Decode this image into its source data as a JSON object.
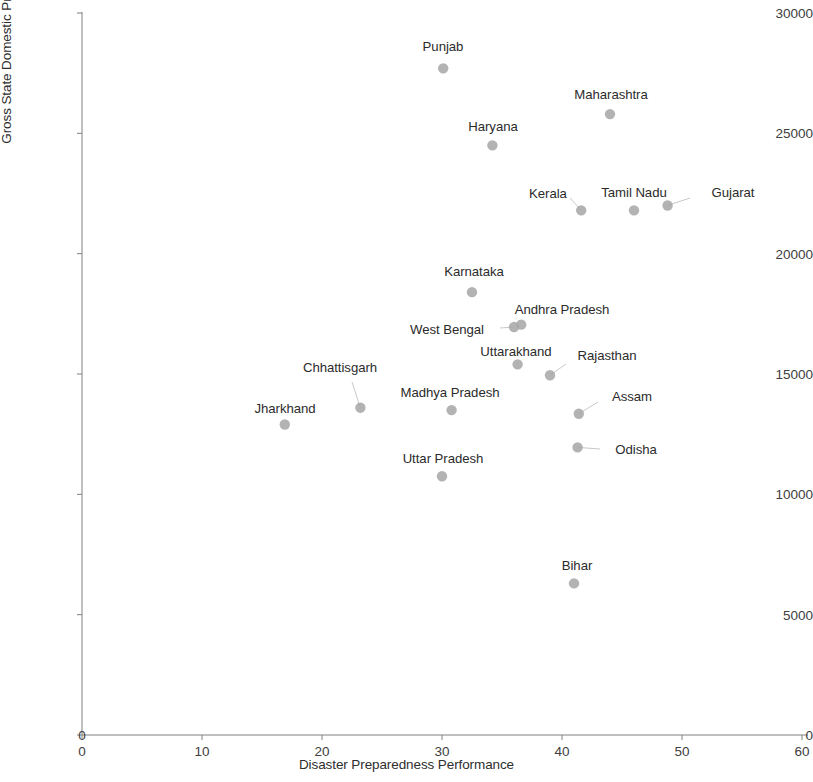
{
  "chart_data": {
    "type": "scatter",
    "title": "",
    "xlabel": "Disaster Preparedness Performance",
    "ylabel": "Gross State Domestic Productper Capita - 1999-2000",
    "xlim": [
      0,
      60
    ],
    "ylim": [
      0,
      30000
    ],
    "xticks": [
      0,
      10,
      20,
      30,
      40,
      50,
      60
    ],
    "yticks": [
      0,
      5000,
      10000,
      15000,
      20000,
      25000,
      30000
    ],
    "xtick_labels": [
      "0",
      "10",
      "20",
      "30",
      "40",
      "50",
      "60"
    ],
    "ytick_labels": [
      "0",
      "5000",
      "10000",
      "15000",
      "20000",
      "25000",
      "30000"
    ],
    "grid": false,
    "legend": false,
    "marker_color": "#a6a6a6",
    "label_color": "#2b2b2b",
    "axis_color": "#808080",
    "points": [
      {
        "name": "Punjab",
        "x": 30.1,
        "y": 27700,
        "lx": 443,
        "ly": 46,
        "leader": false
      },
      {
        "name": "Maharashtra",
        "x": 44.0,
        "y": 25800,
        "lx": 611,
        "ly": 94,
        "leader": false
      },
      {
        "name": "Haryana",
        "x": 34.2,
        "y": 24500,
        "lx": 493,
        "ly": 126,
        "leader": false
      },
      {
        "name": "Kerala",
        "x": 41.6,
        "y": 21800,
        "lx": 548,
        "ly": 193,
        "leader": true,
        "lux": 570,
        "luy": 198
      },
      {
        "name": "Tamil Nadu",
        "x": 46.0,
        "y": 21800,
        "lx": 634,
        "ly": 192,
        "leader": false
      },
      {
        "name": "Gujarat",
        "x": 48.8,
        "y": 22000,
        "lx": 733,
        "ly": 192,
        "leader": true,
        "lux": 690,
        "luy": 198
      },
      {
        "name": "Karnataka",
        "x": 32.5,
        "y": 18400,
        "lx": 474,
        "ly": 271,
        "leader": false
      },
      {
        "name": "Andhra Pradesh",
        "x": 36.6,
        "y": 17050,
        "lx": 562,
        "ly": 309,
        "leader": false
      },
      {
        "name": "West Bengal",
        "x": 36.0,
        "y": 16950,
        "lx": 447,
        "ly": 329,
        "leader": true,
        "lux": 500,
        "luy": 328
      },
      {
        "name": "Uttarakhand",
        "x": 36.3,
        "y": 15400,
        "lx": 516,
        "ly": 351,
        "leader": false
      },
      {
        "name": "Rajasthan",
        "x": 39.0,
        "y": 14950,
        "lx": 607,
        "ly": 355,
        "leader": true,
        "lux": 566,
        "luy": 364
      },
      {
        "name": "Chhattisgarh",
        "x": 23.2,
        "y": 13600,
        "lx": 340,
        "ly": 367,
        "leader": true,
        "lux": 352,
        "luy": 382
      },
      {
        "name": "Madhya Pradesh",
        "x": 30.8,
        "y": 13500,
        "lx": 450,
        "ly": 392,
        "leader": false
      },
      {
        "name": "Assam",
        "x": 41.4,
        "y": 13350,
        "lx": 632,
        "ly": 396,
        "leader": true,
        "lux": 598,
        "luy": 402
      },
      {
        "name": "Jharkhand",
        "x": 16.9,
        "y": 12900,
        "lx": 285,
        "ly": 408,
        "leader": false
      },
      {
        "name": "Odisha",
        "x": 41.3,
        "y": 11950,
        "lx": 636,
        "ly": 449,
        "leader": true,
        "lux": 600,
        "luy": 449
      },
      {
        "name": "Uttar Pradesh",
        "x": 30.0,
        "y": 10750,
        "lx": 443,
        "ly": 458,
        "leader": false
      },
      {
        "name": "Bihar",
        "x": 41.0,
        "y": 6300,
        "lx": 577,
        "ly": 565,
        "leader": false
      }
    ]
  },
  "axes": {
    "origin_extra_label": "0"
  }
}
